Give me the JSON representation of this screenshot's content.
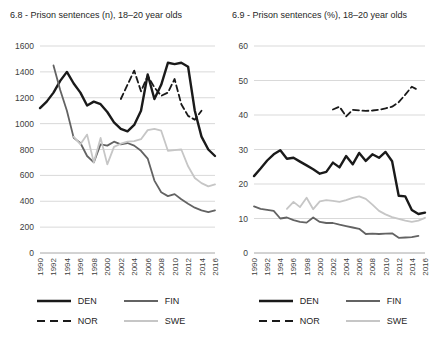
{
  "figure": {
    "background": "#ffffff",
    "grid_color": "#d9d9d9",
    "axis_color": "#a6a6a6",
    "tick_label_color": "#404040"
  },
  "chart_data": [
    {
      "type": "line",
      "title": "6.8 - Prison sentences (n), 18–20 year olds",
      "xlabel": "",
      "ylabel": "",
      "ylim": [
        0,
        1600
      ],
      "y_ticks": [
        0,
        200,
        400,
        600,
        800,
        1000,
        1200,
        1400,
        1600
      ],
      "x_ticks": [
        1990,
        1992,
        1994,
        1996,
        1998,
        2000,
        2002,
        2004,
        2006,
        2008,
        2010,
        2012,
        2014,
        2016
      ],
      "grid": true,
      "legend_position": "bottom",
      "series": [
        {
          "name": "DEN",
          "color": "#1a1a1a",
          "style": "solid",
          "width": 2.4,
          "start_year": 1990,
          "values": [
            1120,
            1170,
            1240,
            1330,
            1400,
            1310,
            1240,
            1140,
            1170,
            1150,
            1090,
            1010,
            960,
            940,
            990,
            1100,
            1380,
            1190,
            1300,
            1470,
            1460,
            1470,
            1440,
            1100,
            900,
            800,
            750
          ]
        },
        {
          "name": "FIN",
          "color": "#636363",
          "style": "solid",
          "width": 1.8,
          "start_year": 1992,
          "values": [
            1450,
            1260,
            1100,
            890,
            850,
            750,
            700,
            840,
            830,
            860,
            840,
            850,
            830,
            790,
            730,
            560,
            470,
            440,
            455,
            415,
            380,
            350,
            330,
            315,
            330
          ]
        },
        {
          "name": "NOR",
          "color": "#1a1a1a",
          "style": "dashed",
          "width": 1.8,
          "start_year": 2002,
          "values": [
            1190,
            1300,
            1410,
            1250,
            1370,
            1280,
            1215,
            1240,
            1345,
            1150,
            1060,
            1030,
            1100
          ]
        },
        {
          "name": "SWE",
          "color": "#c6c6c6",
          "style": "solid",
          "width": 1.8,
          "start_year": 1995,
          "values": [
            900,
            840,
            915,
            700,
            890,
            685,
            820,
            845,
            860,
            865,
            880,
            950,
            960,
            945,
            790,
            795,
            800,
            670,
            580,
            540,
            515,
            530
          ]
        }
      ]
    },
    {
      "type": "line",
      "title": "6.9 - Prison sentences (%), 18–20 year olds",
      "xlabel": "",
      "ylabel": "",
      "ylim": [
        0,
        60
      ],
      "y_ticks": [
        0,
        10,
        20,
        30,
        40,
        50,
        60
      ],
      "x_ticks": [
        1990,
        1992,
        1994,
        1996,
        1998,
        2000,
        2002,
        2004,
        2006,
        2008,
        2010,
        2012,
        2014,
        2016
      ],
      "grid": true,
      "legend_position": "bottom",
      "series": [
        {
          "name": "DEN",
          "color": "#1a1a1a",
          "style": "solid",
          "width": 2.4,
          "start_year": 1990,
          "values": [
            22.3,
            24.5,
            26.8,
            28.6,
            29.8,
            27.3,
            27.6,
            26.5,
            25.4,
            24.3,
            23.0,
            23.5,
            26.2,
            24.8,
            28.1,
            25.7,
            29.0,
            26.7,
            28.6,
            27.6,
            29.3,
            26.6,
            16.6,
            16.4,
            12.5,
            11.3,
            11.7
          ]
        },
        {
          "name": "FIN",
          "color": "#636363",
          "style": "solid",
          "width": 1.8,
          "start_year": 1990,
          "values": [
            13.5,
            12.8,
            12.5,
            12.2,
            10.0,
            10.3,
            9.5,
            9.0,
            8.8,
            10.3,
            9.0,
            8.7,
            8.7,
            8.2,
            7.8,
            7.4,
            7.0,
            5.5,
            5.6,
            5.5,
            5.6,
            5.7,
            4.4,
            4.5,
            4.6,
            5.0
          ]
        },
        {
          "name": "NOR",
          "color": "#1a1a1a",
          "style": "dashed",
          "width": 1.8,
          "start_year": 2002,
          "values": [
            41.6,
            42.4,
            39.6,
            41.5,
            41.3,
            41.2,
            41.3,
            41.5,
            41.9,
            42.4,
            43.7,
            45.9,
            48.2,
            47.2
          ]
        },
        {
          "name": "SWE",
          "color": "#c6c6c6",
          "style": "solid",
          "width": 1.8,
          "start_year": 1995,
          "values": [
            12.8,
            14.8,
            13.3,
            16.0,
            12.7,
            15.0,
            15.3,
            15.1,
            14.8,
            15.3,
            16.0,
            16.4,
            15.7,
            14.0,
            12.2,
            11.2,
            10.4,
            9.9,
            9.4,
            9.0,
            9.4,
            10.2
          ]
        }
      ]
    }
  ]
}
